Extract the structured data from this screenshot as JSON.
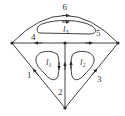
{
  "diagram": {
    "title": "",
    "colors": {
      "line": "#2a2a2a",
      "text": "#333333",
      "background": "#ffffff"
    },
    "nodes": [
      {
        "id": "left",
        "x": 12,
        "y": 43
      },
      {
        "id": "center",
        "x": 65,
        "y": 43
      },
      {
        "id": "right",
        "x": 118,
        "y": 43
      },
      {
        "id": "bottom",
        "x": 65,
        "y": 108
      }
    ],
    "branches": [
      {
        "id": "1",
        "label": "1",
        "from": "bottom",
        "to": "left"
      },
      {
        "id": "2",
        "label": "2",
        "from": "bottom",
        "to": "center"
      },
      {
        "id": "3",
        "label": "3",
        "from": "bottom",
        "to": "right"
      },
      {
        "id": "4",
        "label": "4",
        "from": "center",
        "to": "left"
      },
      {
        "id": "5",
        "label": "5",
        "from": "center",
        "to": "right"
      },
      {
        "id": "6",
        "label": "6",
        "from": "left",
        "to": "right"
      }
    ],
    "loops": [
      {
        "id": "l1",
        "label": "l",
        "sub": "1",
        "direction": "clockwise"
      },
      {
        "id": "l2",
        "label": "l",
        "sub": "2",
        "direction": "counterclockwise"
      },
      {
        "id": "l3",
        "label": "l",
        "sub": "3",
        "direction": "clockwise"
      }
    ]
  }
}
